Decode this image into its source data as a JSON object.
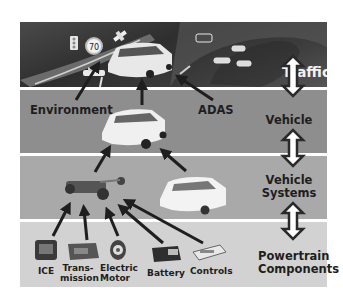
{
  "layers": [
    {
      "id": "traffic",
      "label": "Traffic",
      "color": "#3a3a3a"
    },
    {
      "id": "vehicle",
      "label": "Vehicle",
      "color": "#8e8e8e"
    },
    {
      "id": "vehicle_systems",
      "label": "Vehicle Systems",
      "line1": "Vehicle",
      "line2": "Systems",
      "color": "#a9a9a9"
    },
    {
      "id": "powertrain",
      "label": "Powertrain Components",
      "line1": "Powertrain",
      "line2": "Components",
      "color": "#d2d2d2"
    }
  ],
  "traffic_icons": {
    "speed_sign": "70",
    "items": [
      "traffic-light",
      "speed-limit-sign",
      "satellite",
      "car",
      "cars-on-road"
    ]
  },
  "vehicle_inputs": {
    "environment": "Environment",
    "adas": "ADAS"
  },
  "components": [
    {
      "id": "ice",
      "line1": "ICE",
      "line2": ""
    },
    {
      "id": "transmission",
      "line1": "Trans-",
      "line2": "mission"
    },
    {
      "id": "electric_motor",
      "line1": "Electric",
      "line2": "Motor"
    },
    {
      "id": "battery",
      "line1": "Battery",
      "line2": ""
    },
    {
      "id": "controls",
      "line1": "Controls",
      "line2": ""
    }
  ]
}
